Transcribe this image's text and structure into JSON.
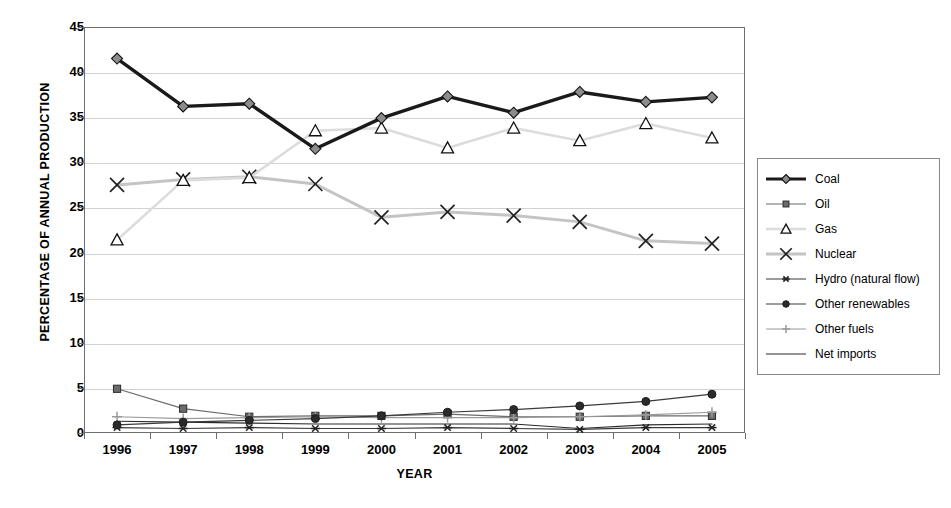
{
  "chart_data": {
    "type": "line",
    "title": "",
    "xlabel": "YEAR",
    "ylabel": "PERCENTAGE OF ANNUAL PRODUCTION",
    "categories": [
      "1996",
      "1997",
      "1998",
      "1999",
      "2000",
      "2001",
      "2002",
      "2003",
      "2004",
      "2005"
    ],
    "x": [
      1996,
      1997,
      1998,
      1999,
      2000,
      2001,
      2002,
      2003,
      2004,
      2005
    ],
    "ylim": [
      0,
      45
    ],
    "yticks": [
      0,
      5,
      10,
      15,
      20,
      25,
      30,
      35,
      40,
      45
    ],
    "grid": true,
    "legend_position": "right",
    "series": [
      {
        "name": "Coal",
        "marker": "diamond",
        "color": "#1a1a1a",
        "line_width": 3.4,
        "marker_fill": "#8c8c8c",
        "values": [
          41.5,
          36.2,
          36.5,
          31.5,
          34.9,
          37.3,
          35.5,
          37.8,
          36.7,
          37.2
        ]
      },
      {
        "name": "Oil",
        "marker": "square",
        "color": "#6b6b6b",
        "line_width": 1.2,
        "marker_fill": "#6b6b6b",
        "values": [
          4.9,
          2.7,
          1.8,
          1.9,
          1.9,
          2.1,
          1.8,
          1.8,
          1.9,
          1.9
        ]
      },
      {
        "name": "Gas",
        "marker": "triangle",
        "color": "#dcdcdc",
        "line_width": 2.6,
        "marker_fill": "#ffffff",
        "values": [
          21.4,
          28.0,
          28.3,
          33.5,
          33.8,
          31.6,
          33.8,
          32.4,
          34.3,
          32.7
        ]
      },
      {
        "name": "Nuclear",
        "marker": "cross-x",
        "color": "#c4c4c4",
        "line_width": 3.0,
        "marker_fill": "none",
        "values": [
          27.5,
          28.1,
          28.4,
          27.6,
          23.9,
          24.5,
          24.1,
          23.4,
          21.3,
          21.0
        ]
      },
      {
        "name": "Hydro (natural flow)",
        "marker": "asterisk",
        "color": "#3a3a3a",
        "line_width": 1.2,
        "marker_fill": "#3a3a3a",
        "values": [
          0.6,
          0.5,
          0.6,
          0.5,
          0.5,
          0.6,
          0.5,
          0.4,
          0.6,
          0.6
        ]
      },
      {
        "name": "Other renewables",
        "marker": "circle",
        "color": "#3a3a3a",
        "line_width": 1.2,
        "marker_fill": "#2b2b2b",
        "values": [
          0.9,
          1.2,
          1.4,
          1.6,
          1.9,
          2.3,
          2.6,
          3.0,
          3.5,
          4.3
        ]
      },
      {
        "name": "Other fuels",
        "marker": "plus",
        "color": "#9a9a9a",
        "line_width": 1.2,
        "marker_fill": "#9a9a9a",
        "values": [
          1.8,
          1.6,
          1.7,
          1.8,
          1.7,
          1.7,
          1.7,
          1.8,
          2.0,
          2.3
        ]
      },
      {
        "name": "Net imports",
        "marker": "none",
        "color": "#2b2b2b",
        "line_width": 1.2,
        "marker_fill": "none",
        "values": [
          1.3,
          1.2,
          1.1,
          1.0,
          1.0,
          1.0,
          1.0,
          0.5,
          0.9,
          1.0
        ]
      }
    ]
  }
}
